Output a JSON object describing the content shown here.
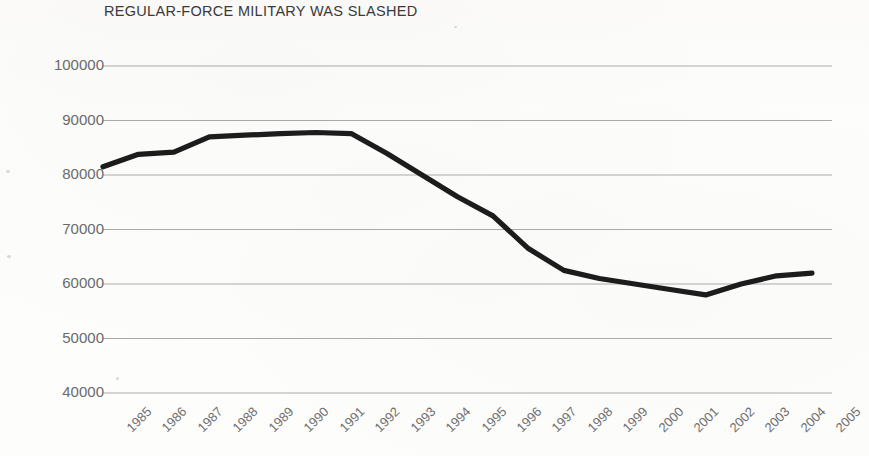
{
  "chart_data": {
    "type": "line",
    "title": "REGULAR-FORCE MILITARY WAS SLASHED",
    "xlabel": "",
    "ylabel": "",
    "grid": true,
    "legend": "none",
    "xlim": [
      1985,
      2005
    ],
    "ylim": [
      40000,
      100000
    ],
    "ytick_labels": [
      "100000",
      "90000",
      "80000",
      "70000",
      "60000",
      "50000",
      "40000"
    ],
    "ytick_values": [
      100000,
      90000,
      80000,
      70000,
      60000,
      50000,
      40000
    ],
    "categories": [
      "1985",
      "1986",
      "1987",
      "1988",
      "1989",
      "1990",
      "1991",
      "1992",
      "1993",
      "1994",
      "1995",
      "1996",
      "1997",
      "1998",
      "1999",
      "2000",
      "2001",
      "2002",
      "2003",
      "2004",
      "2005"
    ],
    "series": [
      {
        "name": "Regular-force military personnel",
        "color": "#1c1c1c",
        "values": [
          81500,
          83800,
          84200,
          87000,
          87300,
          87600,
          87800,
          87600,
          84000,
          80000,
          76000,
          72500,
          66500,
          62500,
          61000,
          60000,
          59000,
          58000,
          60000,
          61500,
          62000
        ]
      }
    ]
  },
  "axis": {
    "line_color": "#a9a9a9",
    "tick_color": "#6f6f6f"
  }
}
